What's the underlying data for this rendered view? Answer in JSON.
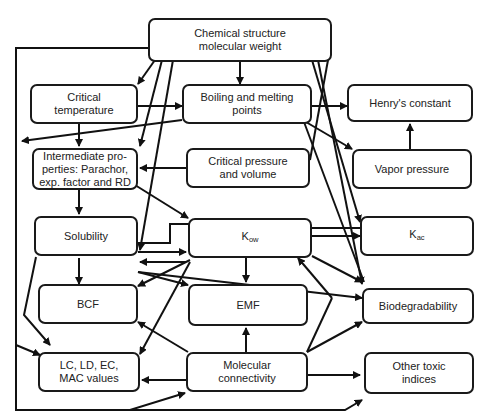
{
  "diagram": {
    "type": "flowchart",
    "nodes": {
      "chem": {
        "label": "Chemical structure\nmolecular weight"
      },
      "crit_temp": {
        "label": "Critical\ntemperature"
      },
      "boil": {
        "label": "Boiling and melting\npoints"
      },
      "henry": {
        "label": "Henry's constant"
      },
      "intermediate": {
        "label": "Intermediate pro-\nperties: Parachor,\nexp. factor and RD"
      },
      "crit_press": {
        "label": "Critical pressure\nand volume"
      },
      "vapor": {
        "label": "Vapor pressure"
      },
      "solubility": {
        "label": "Solubility"
      },
      "kow": {
        "label": "K",
        "sub": "ow"
      },
      "kac": {
        "label": "K",
        "sub": "ac"
      },
      "bcf": {
        "label": "BCF"
      },
      "emf": {
        "label": "EMF"
      },
      "biodeg": {
        "label": "Biodegradability"
      },
      "lc": {
        "label": "LC, LD, EC,\nMAC values"
      },
      "molcon": {
        "label": "Molecular\nconnectivity"
      },
      "other": {
        "label": "Other toxic\nindices"
      }
    },
    "edges": [
      [
        "chem",
        "crit_temp"
      ],
      [
        "chem",
        "boil"
      ],
      [
        "chem",
        "intermediate"
      ],
      [
        "chem",
        "solubility"
      ],
      [
        "chem",
        "kac"
      ],
      [
        "chem",
        "biodeg"
      ],
      [
        "chem",
        "other"
      ],
      [
        "crit_temp",
        "boil"
      ],
      [
        "crit_temp",
        "intermediate"
      ],
      [
        "boil",
        "henry"
      ],
      [
        "boil",
        "vapor"
      ],
      [
        "boil",
        "intermediate"
      ],
      [
        "boil",
        "biodeg"
      ],
      [
        "vapor",
        "henry"
      ],
      [
        "crit_press",
        "intermediate"
      ],
      [
        "intermediate",
        "solubility"
      ],
      [
        "intermediate",
        "kow"
      ],
      [
        "intermediate",
        "kac"
      ],
      [
        "solubility",
        "kow"
      ],
      [
        "kow",
        "solubility"
      ],
      [
        "solubility",
        "bcf"
      ],
      [
        "solubility",
        "emf"
      ],
      [
        "solubility",
        "biodeg"
      ],
      [
        "solubility",
        "lc"
      ],
      [
        "kow",
        "kac"
      ],
      [
        "kow",
        "emf"
      ],
      [
        "kow",
        "bcf"
      ],
      [
        "kow",
        "biodeg"
      ],
      [
        "kow",
        "lc"
      ],
      [
        "molcon",
        "emf"
      ],
      [
        "molcon",
        "bcf"
      ],
      [
        "molcon",
        "lc"
      ],
      [
        "molcon",
        "kow"
      ],
      [
        "molcon",
        "biodeg"
      ],
      [
        "molcon",
        "other"
      ],
      [
        "chem",
        "molcon"
      ]
    ]
  }
}
